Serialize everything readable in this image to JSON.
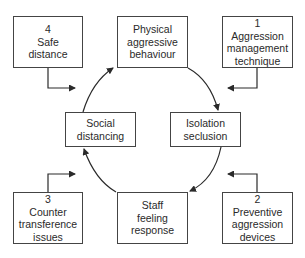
{
  "cycle": [
    {
      "id": "physical",
      "lines": [
        "Physical",
        "aggressive",
        "behaviour"
      ]
    },
    {
      "id": "isolation",
      "lines": [
        "Isolation",
        "seclusion"
      ]
    },
    {
      "id": "staff",
      "lines": [
        "Staff",
        "feeling",
        "response"
      ]
    },
    {
      "id": "social",
      "lines": [
        "Social",
        "distancing"
      ]
    }
  ],
  "interventions": [
    {
      "number": "1",
      "lines": [
        "Aggression",
        "management",
        "technique"
      ]
    },
    {
      "number": "2",
      "lines": [
        "Preventive",
        "aggression",
        "devices"
      ]
    },
    {
      "number": "3",
      "lines": [
        "Counter",
        "transference",
        "issues"
      ]
    },
    {
      "number": "4",
      "lines": [
        "Safe",
        "distance"
      ]
    }
  ],
  "colors": {
    "line": "#2a2a2a",
    "border": "#444444"
  }
}
